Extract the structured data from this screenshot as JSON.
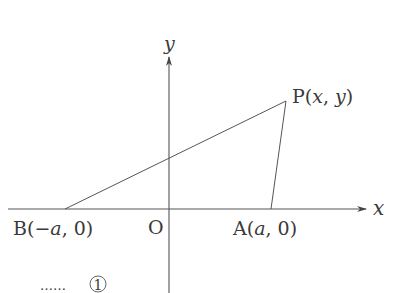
{
  "diagram": {
    "axes": {
      "x_label": "x",
      "y_label": "y",
      "origin_label": "O"
    },
    "points": {
      "B": {
        "name": "B",
        "coords": "(−a, 0)",
        "open": "(",
        "neg": "−",
        "var": "a",
        "sep": ",",
        "zero": "0",
        "close": ")"
      },
      "A": {
        "name": "A",
        "coords": "(a, 0)",
        "open": "(",
        "var": "a",
        "sep": ",",
        "zero": "0",
        "close": ")"
      },
      "P": {
        "name": "P",
        "coords": "(x, y)",
        "open": "(",
        "xvar": "x",
        "sep": ",",
        "yvar": "y",
        "close": ")"
      }
    },
    "segments": [
      "BP",
      "AP"
    ],
    "annotation": {
      "dots": "……",
      "circled_number": "1"
    },
    "colors": {
      "line": "#555555",
      "text": "#3a3a3a",
      "background": "#ffffff"
    }
  }
}
